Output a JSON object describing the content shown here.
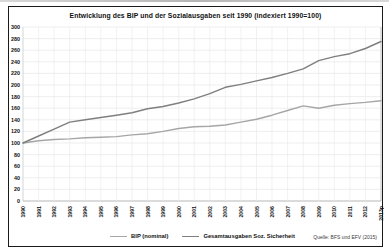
{
  "chart_data": {
    "type": "line",
    "title": "Entwicklung des BIP und der Sozialausgaben seit 1990 (indexiert 1990=100)",
    "categories": [
      "1990",
      "1991",
      "1992",
      "1993",
      "1994",
      "1995",
      "1996",
      "1997",
      "1998",
      "1999",
      "2000",
      "2001",
      "2002",
      "2003",
      "2004",
      "2005",
      "2006",
      "2007",
      "2008",
      "2009",
      "2010",
      "2011",
      "2012",
      "2013p"
    ],
    "series": [
      {
        "name": "BIP (nominal)",
        "color": "#a6a6a6",
        "values": [
          100,
          104,
          106,
          107,
          109,
          110,
          111,
          114,
          116,
          120,
          125,
          128,
          129,
          131,
          136,
          141,
          148,
          156,
          164,
          160,
          165,
          168,
          170,
          173
        ]
      },
      {
        "name": "Gesamtausgaben Soz. Sicherheit",
        "color": "#7f7f7f",
        "values": [
          100,
          112,
          124,
          136,
          140,
          144,
          148,
          152,
          159,
          163,
          169,
          176,
          185,
          196,
          201,
          207,
          213,
          220,
          228,
          242,
          249,
          254,
          263,
          275
        ]
      }
    ],
    "xlabel": "",
    "ylabel": "",
    "ylim": [
      0,
      300
    ],
    "ytick_step": 20,
    "grid": true,
    "legend_position": "bottom",
    "x_label_rotation": -90,
    "source": "Quelle: BFS und EFV (2015)",
    "grid_color": "#eae7e7",
    "axis_color": "#9a9a9a"
  }
}
